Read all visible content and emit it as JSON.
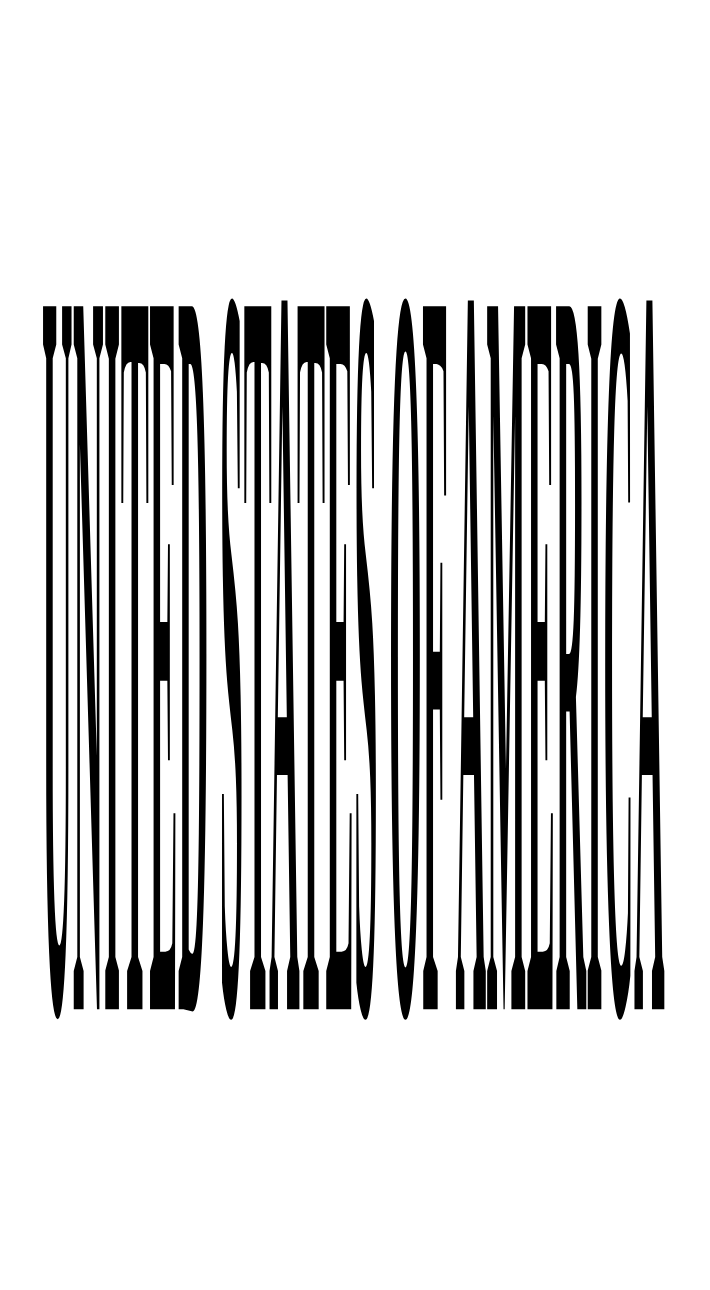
{
  "document": {
    "kind": "stretched-typography",
    "title": "UNITED STATES OF AMERICA",
    "description": "Bold condensed serif capitals rendered at an extreme vertical aspect ratio, appearing as tall narrow black strokes on a white field.",
    "background_color": "#ffffff",
    "ink_color": "#000000"
  },
  "artwork": {
    "text": "UNITED STATES OF AMERICA",
    "words": [
      {
        "index": 0,
        "text": "UNITED",
        "letters": [
          "U",
          "N",
          "I",
          "T",
          "E",
          "D"
        ]
      },
      {
        "index": 1,
        "text": "STATES",
        "letters": [
          "S",
          "T",
          "A",
          "T",
          "E",
          "S"
        ]
      },
      {
        "index": 2,
        "text": "OF",
        "letters": [
          "O",
          "F"
        ]
      },
      {
        "index": 3,
        "text": "AMERICA",
        "letters": [
          "A",
          "M",
          "E",
          "R",
          "I",
          "C",
          "A"
        ]
      }
    ],
    "letter_count": 21,
    "word_count": 4,
    "case": "uppercase",
    "weight": "bold",
    "style": "serif",
    "fill_color": "#000000",
    "text_block": {
      "left_px": 42,
      "top_px": 52,
      "right_px": 665,
      "bottom_px": 1242,
      "width_px": 623,
      "height_px": 1190
    },
    "render": {
      "base_font_size_px": 120,
      "base_letter_spacing_px": 1,
      "scale_x": 1.0,
      "scale_y": 13.6,
      "word_space_px": 22
    }
  },
  "canvas": {
    "width_px": 710,
    "height_px": 1290,
    "margin_top_px": 52,
    "margin_bottom_px": 48,
    "margin_left_px": 42,
    "margin_right_px": 45
  }
}
